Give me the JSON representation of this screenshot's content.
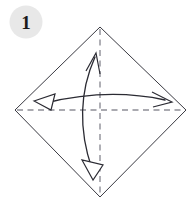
{
  "canvas": {
    "width": 195,
    "height": 205,
    "background_color": "#ffffff"
  },
  "step_badge": {
    "label": "1",
    "circle_color": "#e8e8e8",
    "label_color": "#1a1a1a",
    "center_x": 26,
    "center_y": 22,
    "radius": 16.5
  },
  "sheet": {
    "name": "square-paper-diamond",
    "shape": "square-rotated-45",
    "fill_color": "#ffffff",
    "stroke_color": "#3a3a42",
    "vertices": [
      {
        "label": "top",
        "x": 100,
        "y": 27
      },
      {
        "label": "right",
        "x": 186,
        "y": 110
      },
      {
        "label": "bottom",
        "x": 100,
        "y": 197
      },
      {
        "label": "left",
        "x": 15,
        "y": 110
      }
    ]
  },
  "creases": [
    {
      "name": "vertical-crease",
      "style": "dashed",
      "color": "#8e8e96",
      "x1": 100,
      "y1": 27,
      "x2": 100,
      "y2": 197
    },
    {
      "name": "horizontal-crease",
      "style": "dashed",
      "color": "#8e8e96",
      "x1": 15,
      "y1": 110,
      "x2": 186,
      "y2": 110
    }
  ],
  "fold_arrows": [
    {
      "name": "vertical-fold-unfold-arrow",
      "orientation": "vertical",
      "double_headed": true,
      "color": "#2b2b33",
      "path": "M 95 55 C 78 92, 78 130, 93 172",
      "head_top": {
        "type": "open",
        "x": 95,
        "y": 55
      },
      "head_bottom": {
        "type": "hollow-triangle",
        "x": 93,
        "y": 172
      }
    },
    {
      "name": "horizontal-fold-unfold-arrow",
      "orientation": "horizontal",
      "double_headed": true,
      "color": "#2b2b33",
      "path": "M 44 103 C 90 93, 128 93, 167 101",
      "head_left": {
        "type": "hollow-triangle",
        "x": 44,
        "y": 103
      },
      "head_right": {
        "type": "open",
        "x": 167,
        "y": 101
      }
    }
  ]
}
